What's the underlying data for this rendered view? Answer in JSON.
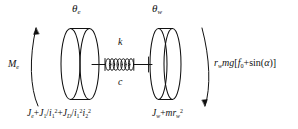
{
  "figure": {
    "kind": "engineering-schematic",
    "background_color": "#ffffff",
    "line_color": "#111111",
    "text_color": "#111111"
  },
  "labels": {
    "theta_engine": {
      "symbol": "θ",
      "subscript": "e",
      "full": "θe",
      "role": "engine-side angular displacement"
    },
    "theta_wheel": {
      "symbol": "θ",
      "subscript": "w",
      "full": "θw",
      "role": "wheel-side angular displacement"
    },
    "spring_stiffness": {
      "symbol": "k",
      "role": "torsional spring stiffness"
    },
    "damping": {
      "symbol": "c",
      "role": "torsional damping coefficient"
    },
    "input_torque": {
      "symbol": "M",
      "subscript": "e",
      "full": "Me",
      "role": "engine input torque"
    },
    "load_torque": {
      "parts": [
        {
          "text": "r",
          "style": "italic"
        },
        {
          "text": "w",
          "style": "subscript"
        },
        {
          "text": "mg",
          "style": "italic"
        },
        {
          "text": "[",
          "style": "upright"
        },
        {
          "text": "f",
          "style": "italic"
        },
        {
          "text": "0",
          "style": "subscript-upright"
        },
        {
          "text": "+",
          "style": "upright"
        },
        {
          "text": "sin",
          "style": "upright"
        },
        {
          "text": "(",
          "style": "upright"
        },
        {
          "text": "α",
          "style": "italic"
        },
        {
          "text": ")]",
          "style": "upright"
        }
      ],
      "full": "rw mg[f0+sin(α)]",
      "role": "wheel load / resistance torque"
    },
    "engine_inertia": {
      "parts": [
        {
          "text": "J",
          "style": "italic"
        },
        {
          "text": "e",
          "style": "subscript"
        },
        {
          "text": "+",
          "style": "upright"
        },
        {
          "text": "J",
          "style": "italic"
        },
        {
          "text": "1",
          "style": "subscript-upright"
        },
        {
          "text": "/",
          "style": "upright"
        },
        {
          "text": "i",
          "style": "italic"
        },
        {
          "text": "1",
          "style": "subscript-upright"
        },
        {
          "text": "2",
          "style": "superscript"
        },
        {
          "text": "+",
          "style": "upright"
        },
        {
          "text": "J",
          "style": "italic"
        },
        {
          "text": "D",
          "style": "subscript"
        },
        {
          "text": "/",
          "style": "upright"
        },
        {
          "text": "i",
          "style": "italic"
        },
        {
          "text": "1",
          "style": "subscript-upright"
        },
        {
          "text": "2",
          "style": "superscript"
        },
        {
          "text": "i",
          "style": "italic"
        },
        {
          "text": "2",
          "style": "subscript-upright"
        },
        {
          "text": "2",
          "style": "superscript"
        }
      ],
      "full": "Je+J1/i1²+JD/i1²i2²",
      "role": "equivalent engine-side inertia"
    },
    "wheel_inertia": {
      "parts": [
        {
          "text": "J",
          "style": "italic"
        },
        {
          "text": "w",
          "style": "subscript"
        },
        {
          "text": "+",
          "style": "upright"
        },
        {
          "text": "m",
          "style": "italic"
        },
        {
          "text": "r",
          "style": "italic"
        },
        {
          "text": "w",
          "style": "subscript"
        },
        {
          "text": "2",
          "style": "superscript"
        }
      ],
      "full": "Jw+mrw²",
      "role": "equivalent wheel-side inertia"
    }
  },
  "arrows": {
    "left_arc": {
      "direction": "counterclockwise-up",
      "role": "engine torque direction indicator"
    },
    "right_arc": {
      "direction": "clockwise-down",
      "role": "load torque direction indicator"
    }
  },
  "components": {
    "left_disc": {
      "name": "engine-inertia-disc",
      "thickness": "thick"
    },
    "right_disc": {
      "name": "wheel-inertia-disc",
      "thickness": "thin"
    },
    "spring": {
      "name": "coil-spring",
      "coils": 7
    },
    "shaft": {
      "name": "connecting-shaft"
    }
  }
}
